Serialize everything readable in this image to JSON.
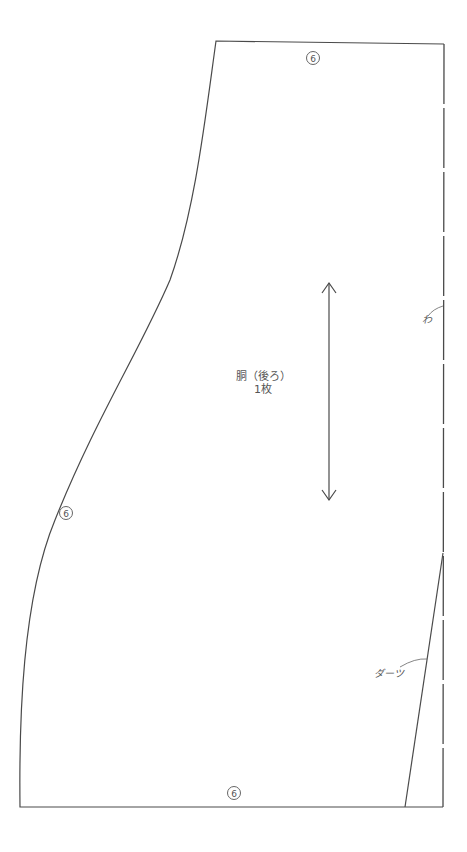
{
  "piece": {
    "name": "胴（後ろ）",
    "count": "1枚"
  },
  "labels": {
    "fold": "わ",
    "dart": "ダーツ"
  },
  "seam_allowance_marks": {
    "top": "6",
    "side": "6",
    "bottom": "6"
  },
  "colors": {
    "line": "#4a4a4a",
    "background": "#ffffff"
  }
}
